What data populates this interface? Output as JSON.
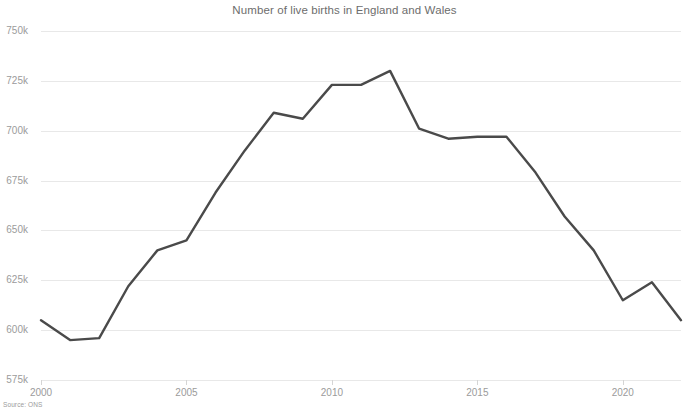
{
  "chart_data": {
    "type": "line",
    "title": "Number of live births in England and Wales",
    "xlabel": "",
    "ylabel": "",
    "source": "Source: ONS",
    "grid": true,
    "legend": "none",
    "line_color": "#4a4a4a",
    "grid_color": "#e8e8e8",
    "axis_text_color": "#9b9b9b",
    "title_color": "#6d6d6d",
    "xlim": [
      2000,
      2022
    ],
    "ylim": [
      575000,
      750000
    ],
    "y_ticks": [
      575000,
      600000,
      625000,
      650000,
      675000,
      700000,
      725000,
      750000
    ],
    "y_tick_labels": [
      "575k",
      "600k",
      "625k",
      "650k",
      "675k",
      "700k",
      "725k",
      "750k"
    ],
    "x_ticks": [
      2000,
      2005,
      2010,
      2015,
      2020
    ],
    "x_tick_labels": [
      "2000",
      "2005",
      "2010",
      "2015",
      "2020"
    ],
    "x": [
      2000,
      2001,
      2002,
      2003,
      2004,
      2005,
      2006,
      2007,
      2008,
      2009,
      2010,
      2011,
      2012,
      2013,
      2014,
      2015,
      2016,
      2017,
      2018,
      2019,
      2020,
      2021,
      2022
    ],
    "values": [
      605000,
      595000,
      596000,
      622000,
      640000,
      645000,
      669000,
      690000,
      709000,
      706000,
      723000,
      723000,
      730000,
      701000,
      696000,
      697000,
      697000,
      679000,
      657000,
      640000,
      615000,
      624000,
      605000
    ],
    "series": [
      {
        "name": "Live births",
        "values": [
          605000,
          595000,
          596000,
          622000,
          640000,
          645000,
          669000,
          690000,
          709000,
          706000,
          723000,
          723000,
          730000,
          701000,
          696000,
          697000,
          697000,
          679000,
          657000,
          640000,
          615000,
          624000,
          605000
        ]
      }
    ]
  }
}
